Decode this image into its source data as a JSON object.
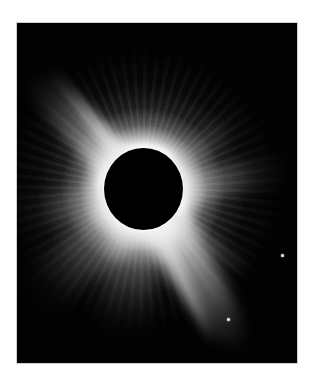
{
  "image": {
    "subject": "Total solar eclipse with coronal streamers",
    "background_color": "#ffffff",
    "frame_color": "#020202",
    "corona_color": "#ffffff",
    "moon_color": "#000000"
  },
  "layout": {
    "frame": {
      "x": 16,
      "y": 22,
      "width": 282,
      "height": 342
    },
    "moon": {
      "cx": 142,
      "cy": 188,
      "rx": 39,
      "ry": 41
    }
  },
  "stars": [
    {
      "name": "star-right",
      "x": 264,
      "y": 231
    },
    {
      "name": "star-lower",
      "x": 210,
      "y": 295
    }
  ]
}
